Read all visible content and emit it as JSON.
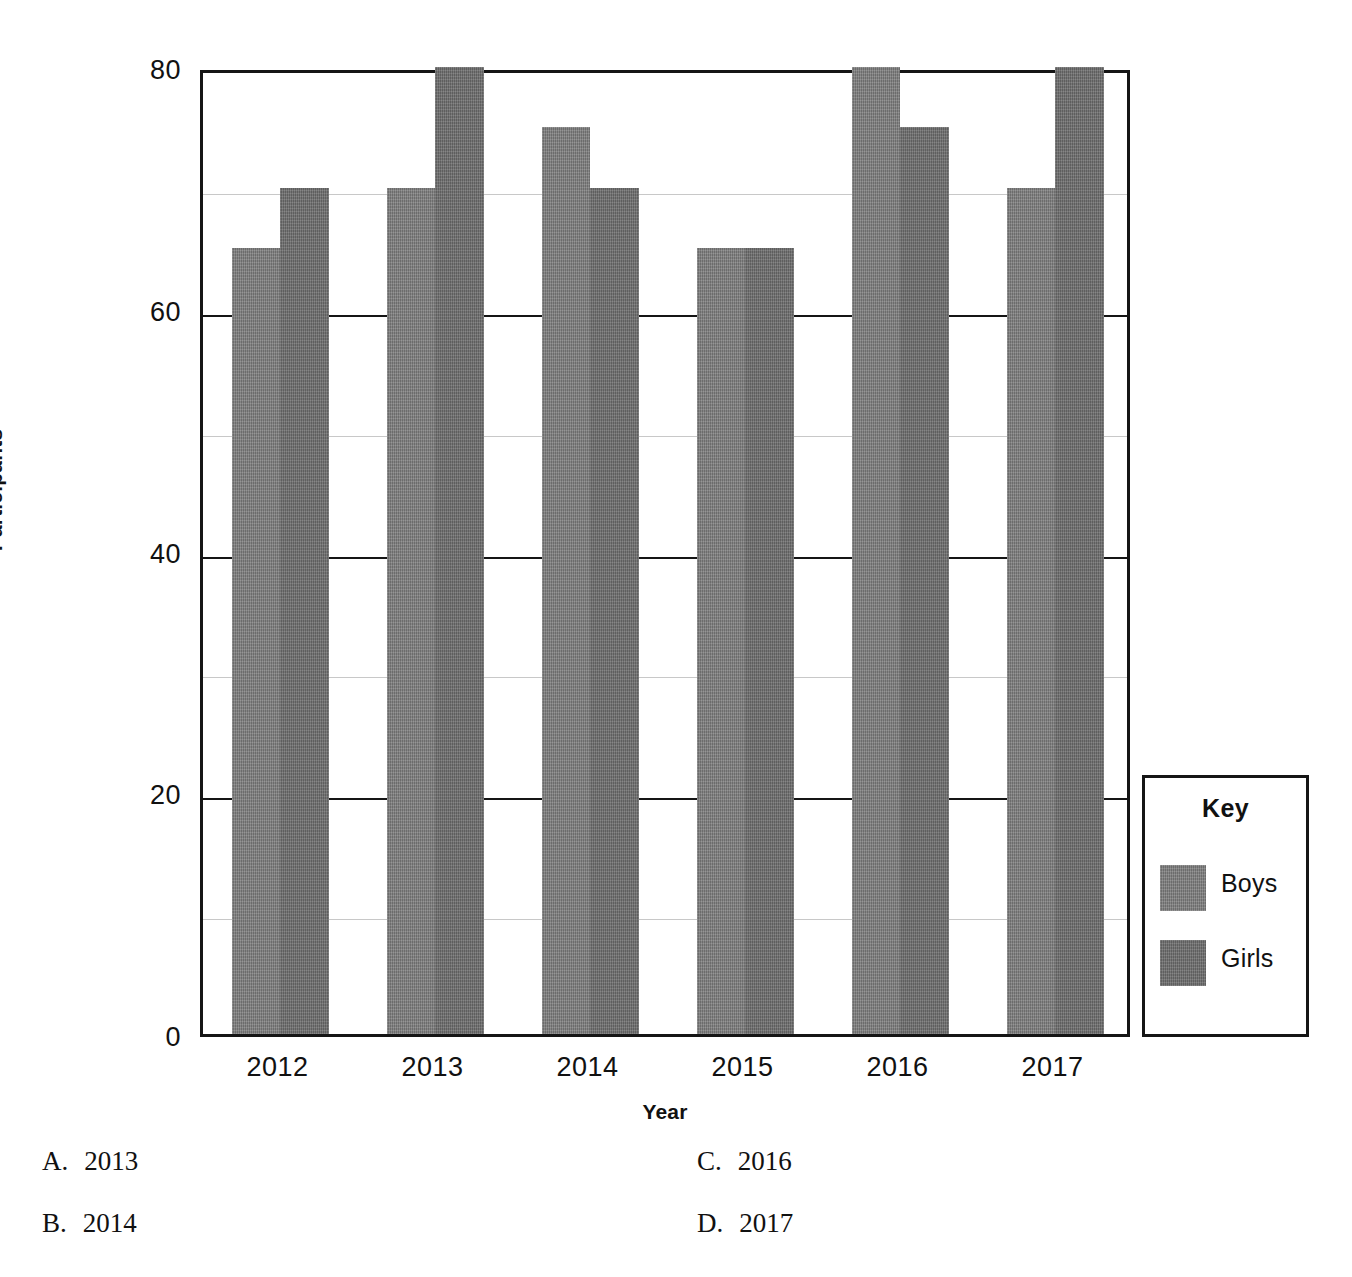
{
  "chart_data": {
    "type": "bar",
    "title": "",
    "xlabel": "Year",
    "ylabel": "Participants",
    "categories": [
      "2012",
      "2013",
      "2014",
      "2015",
      "2016",
      "2017"
    ],
    "series": [
      {
        "name": "Boys",
        "values": [
          65,
          70,
          75,
          65,
          80,
          70
        ],
        "color": "#7b7b7b"
      },
      {
        "name": "Girls",
        "values": [
          70,
          80,
          70,
          65,
          75,
          80
        ],
        "color": "#6e6e6e"
      }
    ],
    "ylim": [
      0,
      80
    ],
    "y_major_ticks": [
      0,
      20,
      40,
      60,
      80
    ],
    "y_minor_ticks": [
      10,
      30,
      50,
      70
    ],
    "y_tick_labels": [
      "0",
      "20",
      "40",
      "60",
      "80"
    ],
    "grid": true,
    "legend_position": "right-outside",
    "legend_title": "Key"
  },
  "legend": {
    "title": "Key",
    "entries": [
      {
        "label": "Boys",
        "color": "#7b7b7b"
      },
      {
        "label": "Girls",
        "color": "#6e6e6e"
      }
    ]
  },
  "answers": {
    "options": [
      {
        "letter": "A.",
        "text": "2013"
      },
      {
        "letter": "B.",
        "text": "2014"
      },
      {
        "letter": "C.",
        "text": "2016"
      },
      {
        "letter": "D.",
        "text": "2017"
      }
    ]
  }
}
